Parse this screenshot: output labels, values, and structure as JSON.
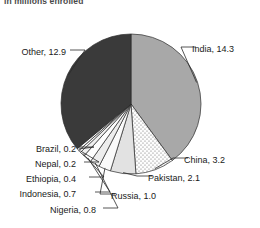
{
  "subtitle": "in millions enrolled",
  "chart_data": {
    "type": "pie",
    "title": "",
    "subtitle": "in millions enrolled",
    "unit": "millions enrolled",
    "xlabel": "",
    "ylabel": "",
    "legend": "none",
    "grid": false,
    "total": 35.8,
    "categories": [
      "India",
      "China",
      "Pakistan",
      "Russia",
      "Nigeria",
      "Indonesia",
      "Ethiopia",
      "Nepal",
      "Brazil",
      "Other"
    ],
    "values": [
      14.3,
      3.2,
      2.1,
      1.0,
      0.8,
      0.7,
      0.4,
      0.2,
      0.2,
      12.9
    ],
    "slices": [
      {
        "name": "India",
        "value": 14.3,
        "label": "India, 14.3",
        "color": "#a8a8a8",
        "pattern": "solid",
        "side": "right"
      },
      {
        "name": "China",
        "value": 3.2,
        "label": "China, 3.2",
        "color": "#f2f2f2",
        "pattern": "dots",
        "side": "right"
      },
      {
        "name": "Pakistan",
        "value": 2.1,
        "label": "Pakistan, 2.1",
        "color": "#e2e2e2",
        "pattern": "solid",
        "side": "right"
      },
      {
        "name": "Russia",
        "value": 1.0,
        "label": "Russia, 1.0",
        "color": "#fafafa",
        "pattern": "solid",
        "side": "right"
      },
      {
        "name": "Nigeria",
        "value": 0.8,
        "label": "Nigeria, 0.8",
        "color": "#ededed",
        "pattern": "solid",
        "side": "left"
      },
      {
        "name": "Indonesia",
        "value": 0.7,
        "label": "Indonesia, 0.7",
        "color": "#fdfdfd",
        "pattern": "solid",
        "side": "left"
      },
      {
        "name": "Ethiopia",
        "value": 0.4,
        "label": "Ethiopia, 0.4",
        "color": "#f0f0f0",
        "pattern": "solid",
        "side": "left"
      },
      {
        "name": "Nepal",
        "value": 0.2,
        "label": "Nepal, 0.2",
        "color": "#fbfbfb",
        "pattern": "solid",
        "side": "left"
      },
      {
        "name": "Brazil",
        "value": 0.2,
        "label": "Brazil, 0.2",
        "color": "#f5f5f5",
        "pattern": "solid",
        "side": "left"
      },
      {
        "name": "Other",
        "value": 12.9,
        "label": "Other, 12.9",
        "color": "#3a3a3a",
        "pattern": "solid",
        "side": "left"
      }
    ]
  },
  "labels": {
    "india": "India, 14.3",
    "china": "China, 3.2",
    "pakistan": "Pakistan, 2.1",
    "russia": "Russia, 1.0",
    "nigeria": "Nigeria, 0.8",
    "indonesia": "Indonesia, 0.7",
    "ethiopia": "Ethiopia, 0.4",
    "nepal": "Nepal, 0.2",
    "brazil": "Brazil, 0.2",
    "other": "Other, 12.9"
  },
  "colors": {
    "outline": "#2b2b2b",
    "text": "#1a1a1a",
    "subtitle": "#4a4a4a",
    "background": "#ffffff"
  }
}
